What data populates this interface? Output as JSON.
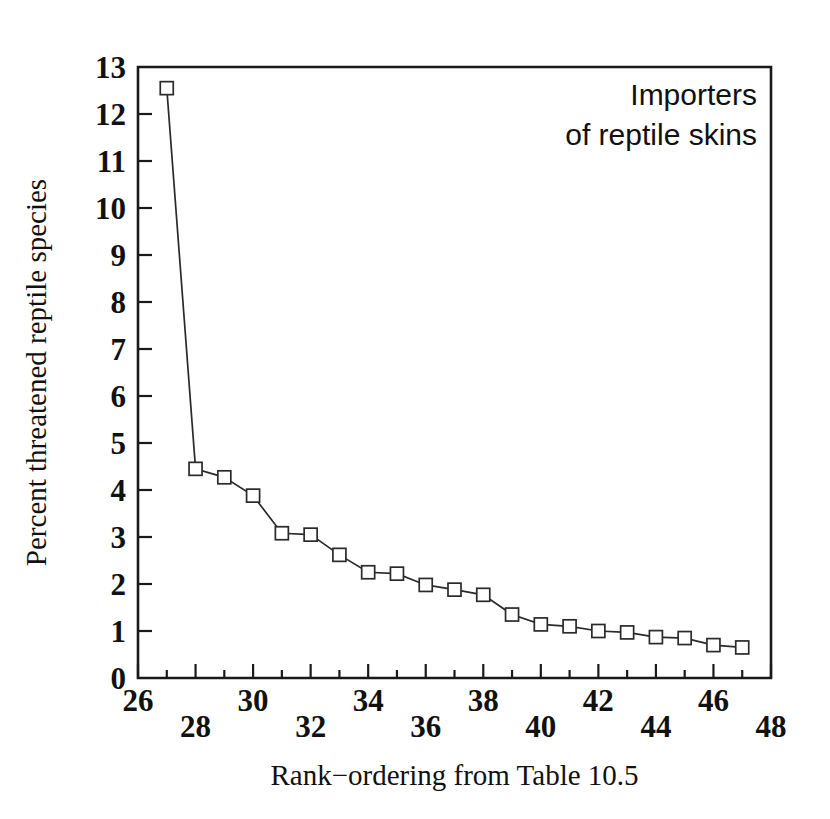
{
  "figure": {
    "background_color": "#ffffff",
    "ink_color": "#1a1a1a",
    "annotation_lines": [
      "Importers",
      "of reptile skins"
    ]
  },
  "chart_data": {
    "type": "line",
    "title": "",
    "annotation": "Importers of reptile skins",
    "xlabel": "Rank−ordering from Table 10.5",
    "ylabel": "Percent threatened reptile species",
    "xlim": [
      26,
      48
    ],
    "ylim": [
      0,
      13
    ],
    "grid": false,
    "legend_position": "none",
    "marker": "open-square",
    "x_tick_labels": [
      "26",
      "28",
      "30",
      "32",
      "34",
      "36",
      "38",
      "40",
      "42",
      "44",
      "46",
      "48"
    ],
    "x_tick_values": [
      26,
      28,
      30,
      32,
      34,
      36,
      38,
      40,
      42,
      44,
      46,
      48
    ],
    "x_minor_tick_values": [
      27,
      29,
      31,
      33,
      35,
      37,
      39,
      41,
      43,
      45,
      47
    ],
    "x_tick_label_stagger": [
      "high",
      "low",
      "high",
      "low",
      "high",
      "low",
      "high",
      "low",
      "high",
      "low",
      "high",
      "low"
    ],
    "y_tick_labels": [
      "0",
      "1",
      "2",
      "3",
      "4",
      "5",
      "6",
      "7",
      "8",
      "9",
      "10",
      "11",
      "12",
      "13"
    ],
    "y_tick_values": [
      0,
      1,
      2,
      3,
      4,
      5,
      6,
      7,
      8,
      9,
      10,
      11,
      12,
      13
    ],
    "x": [
      27,
      28,
      29,
      30,
      31,
      32,
      33,
      34,
      35,
      36,
      37,
      38,
      39,
      40,
      41,
      42,
      43,
      44,
      45,
      46,
      47
    ],
    "values": [
      12.55,
      4.45,
      4.27,
      3.88,
      3.08,
      3.05,
      2.62,
      2.25,
      2.22,
      1.98,
      1.88,
      1.77,
      1.35,
      1.14,
      1.1,
      1.0,
      0.97,
      0.87,
      0.85,
      0.7,
      0.65
    ]
  }
}
